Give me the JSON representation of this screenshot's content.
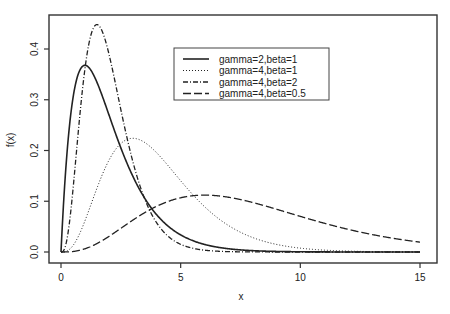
{
  "chart_data": {
    "type": "line",
    "title": "",
    "xlabel": "x",
    "ylabel": "f(x)",
    "xlim": [
      0,
      15
    ],
    "ylim": [
      0,
      0.45
    ],
    "x_ticks": [
      0,
      5,
      10,
      15
    ],
    "x_tick_labels": [
      "0",
      "5",
      "10",
      "15"
    ],
    "y_ticks": [
      0.0,
      0.1,
      0.2,
      0.3,
      0.4
    ],
    "y_tick_labels": [
      "0.0",
      "0.1",
      "0.2",
      "0.3",
      "0.4"
    ],
    "grid": false,
    "legend_position": "top-center",
    "series": [
      {
        "name": "gamma=2,beta=1",
        "shape": 2,
        "rate": 1,
        "line_style": "solid",
        "peak_x": 1.0,
        "peak_y": 0.368
      },
      {
        "name": "gamma=4,beta=1",
        "shape": 4,
        "rate": 1,
        "line_style": "dotted",
        "peak_x": 3.0,
        "peak_y": 0.224
      },
      {
        "name": "gamma=4,beta=2",
        "shape": 4,
        "rate": 2,
        "line_style": "dash-dot",
        "peak_x": 1.5,
        "peak_y": 0.448
      },
      {
        "name": "gamma=4,beta=0.5",
        "shape": 4,
        "rate": 0.5,
        "line_style": "long-dash",
        "peak_x": 6.0,
        "peak_y": 0.112
      }
    ]
  }
}
